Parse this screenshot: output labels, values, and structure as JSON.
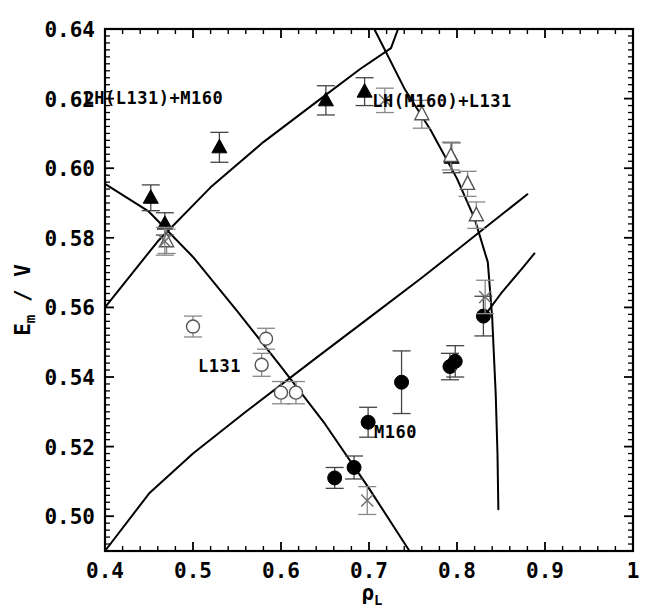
{
  "chart_data": {
    "type": "scatter",
    "title": "",
    "xlabel": "ρ_L",
    "ylabel": "E_m / V",
    "xlim": [
      0.4,
      1.0
    ],
    "ylim": [
      0.49,
      0.64
    ],
    "grid": false,
    "legend_position": "none",
    "x_ticks": [
      "0.4",
      "0.5",
      "0.6",
      "0.7",
      "0.8",
      "0.9",
      "1"
    ],
    "x_tick_values": [
      0.4,
      0.5,
      0.6,
      0.7,
      0.8,
      0.9,
      1.0
    ],
    "x_minor_step": 0.02,
    "y_ticks": [
      "0.50",
      "0.52",
      "0.54",
      "0.56",
      "0.58",
      "0.60",
      "0.62",
      "0.64"
    ],
    "y_tick_values": [
      0.5,
      0.52,
      0.54,
      0.56,
      0.58,
      0.6,
      0.62,
      0.64
    ],
    "y_minor_step": 0.002,
    "annotations": [
      {
        "id": "lh-l131-m160",
        "text": "LH(L131)+M160",
        "x": 0.455,
        "y": 0.6185
      },
      {
        "id": "lh-m160-l131",
        "text": "LH(M160)+L131",
        "x": 0.783,
        "y": 0.6175
      },
      {
        "id": "l131",
        "text": "L131",
        "x": 0.53,
        "y": 0.5415
      },
      {
        "id": "m160",
        "text": "M160",
        "x": 0.73,
        "y": 0.5225
      }
    ],
    "series": [
      {
        "name": "LH(L131)+M160",
        "marker": "filled-triangle",
        "color": "#000000",
        "points": [
          {
            "x": 0.452,
            "y": 0.5915,
            "yerr": 0.0037
          },
          {
            "x": 0.468,
            "y": 0.584,
            "yerr": 0.0032
          },
          {
            "x": 0.53,
            "y": 0.606,
            "yerr": 0.0043
          },
          {
            "x": 0.651,
            "y": 0.6195,
            "yerr": 0.0042
          },
          {
            "x": 0.695,
            "y": 0.622,
            "yerr": 0.004
          },
          {
            "x": 0.794,
            "y": 0.603,
            "yerr": 0.0043
          }
        ]
      },
      {
        "name": "LH(M160)+L131",
        "marker": "open-triangle",
        "color": "#555555",
        "points": [
          {
            "x": 0.47,
            "y": 0.579,
            "yerr": 0.0035
          },
          {
            "x": 0.76,
            "y": 0.6155,
            "yerr": 0.004
          },
          {
            "x": 0.793,
            "y": 0.6035,
            "yerr": 0.004
          },
          {
            "x": 0.812,
            "y": 0.5955,
            "yerr": 0.0036
          },
          {
            "x": 0.822,
            "y": 0.5865,
            "yerr": 0.0038
          }
        ]
      },
      {
        "name": "L131",
        "marker": "open-circle",
        "color": "#555555",
        "points": [
          {
            "x": 0.5,
            "y": 0.5545,
            "yerr": 0.003
          },
          {
            "x": 0.583,
            "y": 0.551,
            "yerr": 0.003
          },
          {
            "x": 0.578,
            "y": 0.5435,
            "yerr": 0.0033
          },
          {
            "x": 0.6,
            "y": 0.5355,
            "yerr": 0.0032
          },
          {
            "x": 0.617,
            "y": 0.5355,
            "yerr": 0.0032
          }
        ]
      },
      {
        "name": "M160",
        "marker": "filled-circle",
        "color": "#000000",
        "points": [
          {
            "x": 0.661,
            "y": 0.511,
            "yerr": 0.003
          },
          {
            "x": 0.683,
            "y": 0.514,
            "yerr": 0.0033
          },
          {
            "x": 0.699,
            "y": 0.527,
            "yerr": 0.0043
          },
          {
            "x": 0.737,
            "y": 0.5385,
            "yerr": 0.009
          },
          {
            "x": 0.792,
            "y": 0.543,
            "yerr": 0.0038
          },
          {
            "x": 0.798,
            "y": 0.5445,
            "yerr": 0.0045
          },
          {
            "x": 0.83,
            "y": 0.5575,
            "yerr": 0.0057
          }
        ]
      },
      {
        "name": "x-markers",
        "marker": "cross",
        "color": "#707070",
        "points": [
          {
            "x": 0.468,
            "y": 0.579,
            "yerr": 0.004
          },
          {
            "x": 0.718,
            "y": 0.6195,
            "yerr": 0.0035
          },
          {
            "x": 0.698,
            "y": 0.5045,
            "yerr": 0.004
          },
          {
            "x": 0.832,
            "y": 0.563,
            "yerr": 0.0048
          }
        ]
      }
    ],
    "curves": [
      {
        "name": "curve-lower-left-descending",
        "points": [
          [
            0.4,
            0.5955
          ],
          [
            0.45,
            0.5875
          ],
          [
            0.5,
            0.5745
          ],
          [
            0.55,
            0.559
          ],
          [
            0.6,
            0.543
          ],
          [
            0.65,
            0.5265
          ],
          [
            0.7,
            0.508
          ],
          [
            0.746,
            0.49
          ]
        ]
      },
      {
        "name": "curve-ascending-m160",
        "points": [
          [
            0.4,
            0.49
          ],
          [
            0.45,
            0.5065
          ],
          [
            0.5,
            0.518
          ],
          [
            0.56,
            0.53
          ],
          [
            0.64,
            0.5455
          ],
          [
            0.7,
            0.557
          ],
          [
            0.76,
            0.5685
          ],
          [
            0.8,
            0.5765
          ],
          [
            0.825,
            0.5815
          ],
          [
            0.88,
            0.5925
          ]
        ]
      },
      {
        "name": "curve-upper-ascending-lh",
        "points": [
          [
            0.4,
            0.56
          ],
          [
            0.46,
            0.579
          ],
          [
            0.52,
            0.5945
          ],
          [
            0.58,
            0.6075
          ],
          [
            0.64,
            0.619
          ],
          [
            0.69,
            0.6285
          ],
          [
            0.725,
            0.6345
          ],
          [
            0.733,
            0.64
          ]
        ]
      },
      {
        "name": "curve-upper-descending-lh",
        "points": [
          [
            0.706,
            0.64
          ],
          [
            0.74,
            0.623
          ],
          [
            0.77,
            0.611
          ],
          [
            0.8,
            0.597
          ],
          [
            0.82,
            0.5855
          ],
          [
            0.835,
            0.573
          ],
          [
            0.84,
            0.557
          ],
          [
            0.844,
            0.535
          ],
          [
            0.846,
            0.518
          ],
          [
            0.847,
            0.502
          ]
        ]
      },
      {
        "name": "curve-right-short-ascending",
        "points": [
          [
            0.828,
            0.5565
          ],
          [
            0.85,
            0.564
          ],
          [
            0.875,
            0.5715
          ],
          [
            0.888,
            0.5755
          ]
        ]
      }
    ]
  },
  "meta": {
    "axis_frame_color": "#000000"
  }
}
